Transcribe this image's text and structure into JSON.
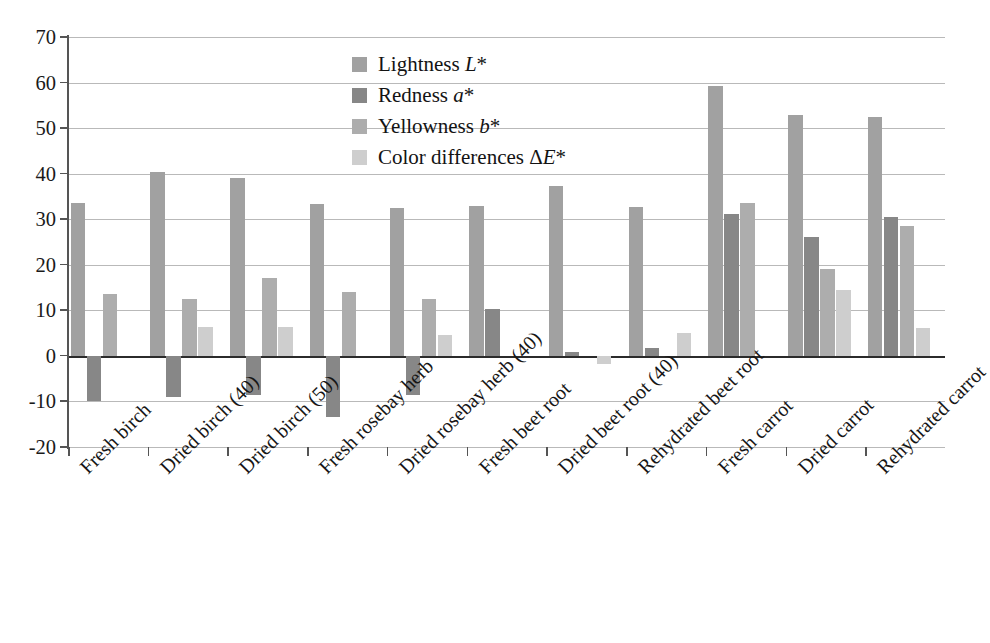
{
  "chart_data": {
    "type": "bar",
    "title": "",
    "xlabel": "",
    "ylabel": "",
    "ylim": [
      -20,
      70
    ],
    "ytick_step": 10,
    "yticks": [
      70,
      60,
      50,
      40,
      30,
      20,
      10,
      0,
      -10,
      -20
    ],
    "ytick_labels": [
      "70",
      "60",
      "50",
      "40",
      "30",
      "20",
      "10",
      "0",
      "-10",
      "-20"
    ],
    "grid": true,
    "grid_axis": "y",
    "legend_position": "upper-center-left",
    "orientation": "vertical",
    "categories": [
      "Fresh birch",
      "Dried birch (40)",
      "Dried birch (50)",
      "Fresh rosebay herb",
      "Dried rosebay herb (40)",
      "Fresh beet root",
      "Dried beet root (40)",
      "Rehydrated beet root",
      "Fresh carrot",
      "Dried carrot",
      "Rehydrated carrot"
    ],
    "series": [
      {
        "name": "Lightness L*",
        "color": "#a1a1a1",
        "values": [
          33.5,
          40.3,
          39.0,
          33.3,
          32.5,
          32.8,
          37.2,
          32.7,
          59.2,
          52.8,
          52.4
        ]
      },
      {
        "name": "Redness a*",
        "color": "#878787",
        "values": [
          -10.0,
          -9.0,
          -8.5,
          -13.5,
          -8.5,
          10.2,
          0.8,
          1.7,
          31.2,
          26.2,
          30.5
        ]
      },
      {
        "name": "Yellowness b*",
        "color": "#adadad",
        "values": [
          13.5,
          12.5,
          17.0,
          14.0,
          12.5,
          null,
          null,
          null,
          33.5,
          19.0,
          28.5
        ]
      },
      {
        "name": "Color differences ΔE*",
        "color": "#cecece",
        "values": [
          null,
          6.4,
          6.4,
          null,
          4.5,
          null,
          -1.8,
          5.0,
          null,
          14.5,
          6.2
        ]
      }
    ],
    "legend": [
      {
        "label_plain": "Lightness L*",
        "label_main": "Lightness ",
        "label_italic": "L",
        "label_tail": "*",
        "color": "#a1a1a1"
      },
      {
        "label_plain": "Redness a*",
        "label_main": "Redness ",
        "label_italic": "a",
        "label_tail": "*",
        "color": "#878787"
      },
      {
        "label_plain": "Yellowness b*",
        "label_main": "Yellowness ",
        "label_italic": "b",
        "label_tail": "*",
        "color": "#adadad"
      },
      {
        "label_plain": "Color differences ΔE*",
        "label_main": "Color differences Δ",
        "label_italic": "E",
        "label_tail": "*",
        "color": "#cecece"
      }
    ],
    "axis_color": "#555555",
    "gridline_color": "#b9b9b9",
    "zero_line_color": "#2b2b2b",
    "background_color": "#ffffff"
  }
}
